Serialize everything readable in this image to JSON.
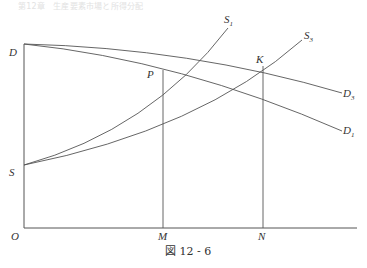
{
  "header": {
    "text": "第12章　生産要素市場と所得分配"
  },
  "diagram": {
    "caption": "図 12 - 6",
    "axes": {
      "origin_label": "O"
    },
    "points": {
      "D": "D",
      "S": "S",
      "P": "P",
      "K": "K",
      "M": "M",
      "N": "N"
    },
    "curves": {
      "S1": {
        "base": "S",
        "sub": "1"
      },
      "S3": {
        "base": "S",
        "sub": "3"
      },
      "D3": {
        "base": "D",
        "sub": "3"
      },
      "D1": {
        "base": "D",
        "sub": "1"
      }
    },
    "colors": {
      "line": "#555555",
      "text": "#333333"
    }
  }
}
